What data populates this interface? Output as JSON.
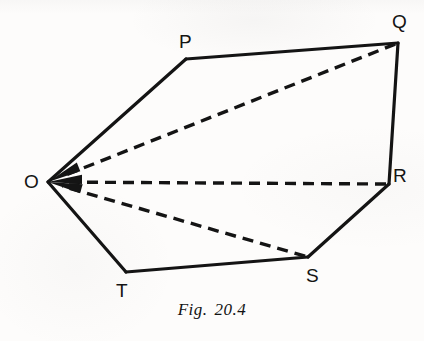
{
  "figure": {
    "caption_prefix": "Fig.",
    "caption_number": "20.4",
    "background_color": "#fdfcfb",
    "ink_color": "#141414"
  },
  "vertices": [
    {
      "id": "O",
      "label": "O",
      "x": 48,
      "y": 182
    },
    {
      "id": "P",
      "label": "P",
      "x": 186,
      "y": 59
    },
    {
      "id": "Q",
      "label": "Q",
      "x": 398,
      "y": 43
    },
    {
      "id": "R",
      "label": "R",
      "x": 389,
      "y": 184
    },
    {
      "id": "S",
      "label": "S",
      "x": 308,
      "y": 257
    },
    {
      "id": "T",
      "label": "T",
      "x": 126,
      "y": 272
    }
  ],
  "solid_edges": [
    {
      "name": "edge-O-P",
      "from": "O",
      "to": "P"
    },
    {
      "name": "edge-P-Q",
      "from": "P",
      "to": "Q"
    },
    {
      "name": "edge-Q-R",
      "from": "Q",
      "to": "R"
    },
    {
      "name": "edge-R-S",
      "from": "R",
      "to": "S"
    },
    {
      "name": "edge-S-T",
      "from": "S",
      "to": "T"
    },
    {
      "name": "edge-T-O",
      "from": "T",
      "to": "O"
    }
  ],
  "dashed_vectors": [
    {
      "name": "vector-Q-to-O",
      "from": "Q",
      "to": "O",
      "arrowhead_at": "O"
    },
    {
      "name": "vector-R-to-O",
      "from": "R",
      "to": "O",
      "arrowhead_at": "O"
    },
    {
      "name": "vector-S-to-O",
      "from": "S",
      "to": "O",
      "arrowhead_at": "O"
    }
  ],
  "style": {
    "solid_stroke_width": 3.2,
    "dashed_stroke_width": 3.4,
    "dash_pattern": "11 7"
  }
}
